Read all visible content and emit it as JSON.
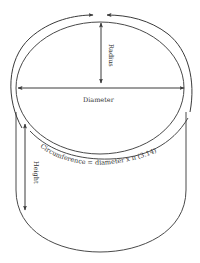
{
  "diagram": {
    "labels": {
      "radius": "Radius",
      "diameter": "Diameter",
      "height": "Height",
      "circumference": "Circumference = diameter x π (3.14)"
    },
    "colors": {
      "stroke": "#4a4a4a",
      "text": "#333333",
      "background": "#ffffff"
    }
  }
}
